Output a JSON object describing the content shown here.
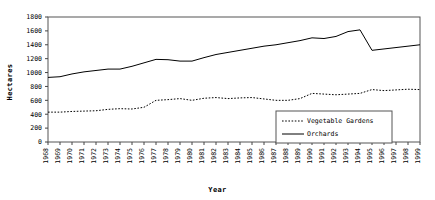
{
  "chart_data": {
    "type": "line",
    "title": "",
    "xlabel": "Year",
    "ylabel": "Hectares",
    "xlim": [
      1968,
      1999
    ],
    "ylim": [
      0,
      1800
    ],
    "ytick_step": 200,
    "grid": false,
    "legend_position": "bottom-right",
    "yticks": [
      "0",
      "200",
      "400",
      "600",
      "800",
      "1000",
      "1200",
      "1400",
      "1600",
      "1800"
    ],
    "categories": [
      "1968",
      "1969",
      "1970",
      "1971",
      "1972",
      "1973",
      "1974",
      "1975",
      "1976",
      "1977",
      "1978",
      "1979",
      "1980",
      "1981",
      "1982",
      "1983",
      "1984",
      "1985",
      "1986",
      "1987",
      "1988",
      "1989",
      "1990",
      "1991",
      "1992",
      "1993",
      "1994",
      "1995",
      "1996",
      "1997",
      "1998",
      "1999"
    ],
    "series": [
      {
        "name": "Vegetable Gardens",
        "style": "dotted",
        "color": "#000000",
        "values": [
          430,
          430,
          440,
          445,
          450,
          470,
          480,
          475,
          500,
          600,
          610,
          625,
          600,
          630,
          640,
          625,
          635,
          640,
          620,
          600,
          600,
          625,
          700,
          690,
          680,
          690,
          700,
          755,
          740,
          750,
          760,
          755
        ]
      },
      {
        "name": "Orchards",
        "style": "solid",
        "color": "#000000",
        "values": [
          930,
          940,
          980,
          1010,
          1030,
          1050,
          1050,
          1090,
          1140,
          1190,
          1185,
          1165,
          1165,
          1215,
          1260,
          1290,
          1320,
          1350,
          1380,
          1400,
          1430,
          1460,
          1500,
          1490,
          1520,
          1590,
          1615,
          1320,
          1340,
          1360,
          1380,
          1400
        ]
      }
    ]
  },
  "legend": {
    "items": [
      {
        "label": "Vegetable Gardens",
        "style": "dotted"
      },
      {
        "label": "Orchards",
        "style": "solid"
      }
    ]
  }
}
